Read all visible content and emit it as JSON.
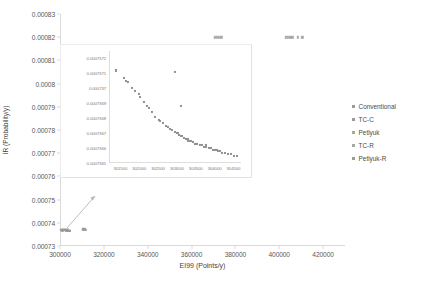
{
  "chart_data": {
    "type": "scatter",
    "title": "",
    "xlabel": "EI99 (Points/y)",
    "ylabel": "IR (Probability/y)",
    "xlim": [
      300000,
      430000
    ],
    "ylim": [
      0.00073,
      0.00083
    ],
    "xticks": [
      "300000",
      "320000",
      "340000",
      "360000",
      "380000",
      "400000",
      "420000"
    ],
    "xtick_values": [
      300000,
      320000,
      340000,
      360000,
      380000,
      400000,
      420000
    ],
    "yticks": [
      "0.00073",
      "0.00074",
      "0.00075",
      "0.00076",
      "0.00077",
      "0.00078",
      "0.00079",
      "0.0008",
      "0.00081",
      "0.00082",
      "0.00083"
    ],
    "ytick_values": [
      0.00073,
      0.00074,
      0.00075,
      0.00076,
      0.00077,
      0.00078,
      0.00079,
      0.0008,
      0.00081,
      0.00082,
      0.00083
    ],
    "grid": false,
    "legend_position": "right",
    "series": [
      {
        "name": "Conventional",
        "marker": "square",
        "color": "#9a9a9a",
        "points": [
          [
            301200,
            0.0007371
          ],
          [
            301500,
            0.000737
          ],
          [
            301800,
            0.000737
          ],
          [
            302100,
            0.0007369
          ],
          [
            302400,
            0.0007369
          ],
          [
            302700,
            0.0007368
          ],
          [
            303000,
            0.0007368
          ],
          [
            303300,
            0.0007367
          ],
          [
            303600,
            0.0007367
          ],
          [
            303900,
            0.0007366
          ],
          [
            304200,
            0.0007366
          ],
          [
            304500,
            0.0007365
          ]
        ]
      },
      {
        "name": "TC-C",
        "marker": "square",
        "color": "#9a9a9a",
        "points": [
          [
            310500,
            0.0007372
          ],
          [
            311000,
            0.0007372
          ],
          [
            311500,
            0.0007371
          ]
        ]
      },
      {
        "name": "Petlyuk",
        "marker": "square",
        "color": "#a8a8a8",
        "points": [
          [
            370500,
            0.00082
          ],
          [
            371500,
            0.00082
          ],
          [
            372500,
            0.00082
          ],
          [
            373500,
            0.00082
          ]
        ]
      },
      {
        "name": "TC-R",
        "marker": "square",
        "color": "#a8a8a8",
        "points": [
          [
            403000,
            0.00082
          ],
          [
            404000,
            0.00082
          ],
          [
            405000,
            0.00082
          ],
          [
            406000,
            0.00082
          ],
          [
            408500,
            0.00082
          ],
          [
            410500,
            0.00082
          ]
        ]
      },
      {
        "name": "Petlyuk-R",
        "marker": "square",
        "color": "#9a9a9a",
        "points": [
          [
            300400,
            0.0007369
          ],
          [
            300900,
            0.0007368
          ],
          [
            301400,
            0.0007368
          ]
        ]
      }
    ],
    "inset": {
      "xlim": [
        301200,
        304700
      ],
      "ylim": [
        0.0007365,
        0.00073725
      ],
      "xticks": [
        "301500",
        "302000",
        "302500",
        "303000",
        "303500",
        "304000",
        "304500"
      ],
      "xtick_values": [
        301500,
        302000,
        302500,
        303000,
        303500,
        304000,
        304500
      ],
      "yticks": [
        "0.0007372",
        "0.0007371",
        "0.000737",
        "0.0007369",
        "0.0007368",
        "0.0007367",
        "0.0007366",
        "0.0007365"
      ],
      "ytick_values": [
        0.0007372,
        0.0007371,
        0.000737,
        0.0007369,
        0.0007368,
        0.0007367,
        0.0007366,
        0.0007365
      ],
      "points": [
        [
          301380,
          0.00073712
        ],
        [
          301600,
          0.00073707
        ],
        [
          301660,
          0.00073705
        ],
        [
          301700,
          0.00073704
        ],
        [
          301820,
          0.000737
        ],
        [
          301900,
          0.00073698
        ],
        [
          302020,
          0.00073694
        ],
        [
          302120,
          0.00073691
        ],
        [
          302210,
          0.00073688
        ],
        [
          302330,
          0.00073684
        ],
        [
          302430,
          0.00073681
        ],
        [
          302530,
          0.00073679
        ],
        [
          302620,
          0.00073677
        ],
        [
          302700,
          0.00073675
        ],
        [
          302760,
          0.00073674
        ],
        [
          302820,
          0.00073673
        ],
        [
          302880,
          0.00073672
        ],
        [
          302940,
          0.00073711
        ],
        [
          302960,
          0.00073671
        ],
        [
          303010,
          0.0007367
        ],
        [
          303060,
          0.00073669
        ],
        [
          303100,
          0.00073688
        ],
        [
          303120,
          0.00073668
        ],
        [
          303180,
          0.00073667
        ],
        [
          303240,
          0.00073666
        ],
        [
          303300,
          0.00073665
        ],
        [
          303360,
          0.00073665
        ],
        [
          303420,
          0.00073664
        ],
        [
          303480,
          0.00073663
        ],
        [
          303540,
          0.00073663
        ],
        [
          303600,
          0.00073662
        ],
        [
          303660,
          0.00073662
        ],
        [
          303720,
          0.00073661
        ],
        [
          303780,
          0.00073661
        ],
        [
          303840,
          0.0007366
        ],
        [
          303900,
          0.0007366
        ],
        [
          303960,
          0.00073659
        ],
        [
          304020,
          0.00073659
        ],
        [
          304080,
          0.00073658
        ],
        [
          304140,
          0.00073658
        ],
        [
          304200,
          0.00073657
        ],
        [
          304280,
          0.00073657
        ],
        [
          304360,
          0.00073656
        ],
        [
          304440,
          0.00073656
        ],
        [
          304520,
          0.00073655
        ],
        [
          304600,
          0.00073655
        ],
        [
          302000,
          0.00073696
        ],
        [
          302250,
          0.00073687
        ],
        [
          302560,
          0.00073678
        ],
        [
          303040,
          0.0007367
        ],
        [
          303280,
          0.00073666
        ],
        [
          303520,
          0.00073663
        ],
        [
          303780,
          0.00073662
        ],
        [
          304050,
          0.00073659
        ]
      ]
    }
  },
  "legend": {
    "items": [
      {
        "label": "Conventional"
      },
      {
        "label": "TC-C"
      },
      {
        "label": "Petlyuk"
      },
      {
        "label": "TC-R"
      },
      {
        "label": "Petlyuk-R"
      }
    ]
  }
}
